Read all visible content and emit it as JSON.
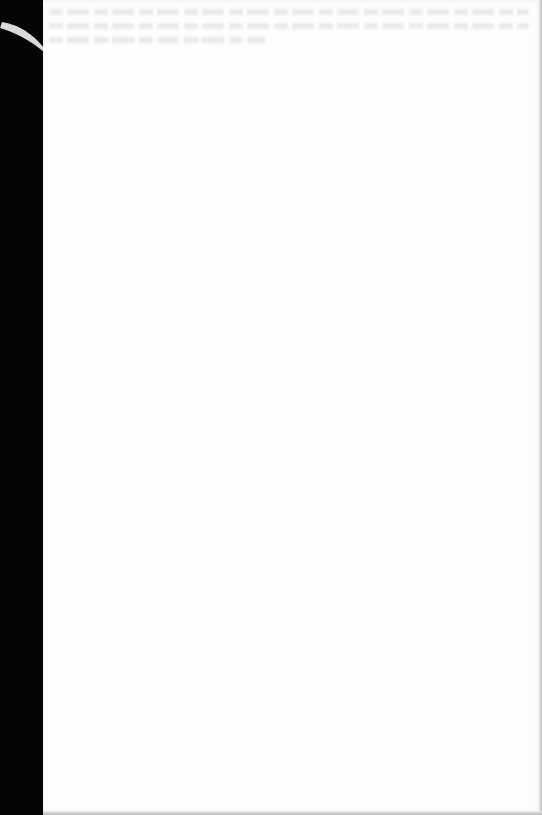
{
  "document": {
    "type": "scanned-blank-page",
    "legible_text": [],
    "colors": {
      "background_margin": "#050505",
      "page": "#fdfdfd",
      "showthrough": "#9a9a9a",
      "corner_curl": "#d9d9d9",
      "edge_shadow": "#bdbdbd"
    },
    "showthrough_lines": 3
  }
}
